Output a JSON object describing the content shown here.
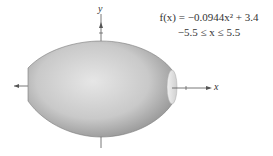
{
  "figure": {
    "type": "solid-of-revolution",
    "shading_colors": {
      "light": "#e2e2e2",
      "mid": "#bdbdbd",
      "dark": "#8e8e8e"
    },
    "axes": {
      "x_label": "x",
      "y_label": "y"
    }
  },
  "formula": {
    "line1": "f(x) = −0.0944x² + 3.4",
    "line2": "−5.5 ≤ x ≤ 5.5"
  }
}
